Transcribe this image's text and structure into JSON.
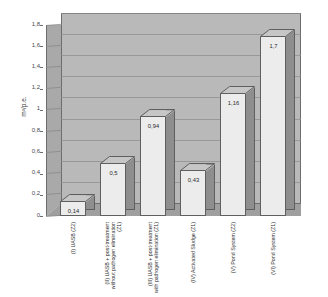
{
  "chart_data": {
    "type": "bar",
    "title": "",
    "subtitle": "",
    "xlabel": "",
    "ylabel": "m³/p.e.",
    "ylim": [
      0,
      1.8
    ],
    "grid": true,
    "legend": "none",
    "style": "3d-column",
    "decimal_separator": ",",
    "categories": [
      "(I) UASB (Z2)",
      "(II) UASB + post-treatment without pathogen elimination (Z1)",
      "(III) UASB + post-treatment with pathogen elimination (Z1)",
      "(IV) Activated Sludge (Z1)",
      "(V) Pond System (Z2)",
      "(VI) Pond System (Z1)"
    ],
    "values": [
      0.14,
      0.5,
      0.94,
      0.43,
      1.16,
      1.7
    ],
    "value_labels": [
      "0,14",
      "0,5",
      "0,94",
      "0,43",
      "1,16",
      "1,7"
    ],
    "ytick_values": [
      0,
      0.2,
      0.4,
      0.6,
      0.8,
      1.0,
      1.2,
      1.4,
      1.6,
      1.8
    ],
    "ytick_labels": [
      "0",
      "0,2",
      "0,4",
      "0,6",
      "0,8",
      "1",
      "1,2",
      "1,4",
      "1,6",
      "1,8"
    ],
    "colors": {
      "bar_front": "#ececec",
      "bar_side": "#8e8e8e",
      "bar_top": "#c6c6c6",
      "plot_back_wall": "#b9b9b9",
      "plot_side_wall": "#a9a9a9",
      "floor": "#9f9f9f",
      "gridline": "#8d8d8d",
      "outline": "#5f5f5f",
      "text": "#2e2e2e",
      "background": "#ffffff"
    }
  }
}
